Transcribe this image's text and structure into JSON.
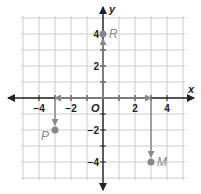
{
  "axes": {
    "x_label": "x",
    "y_label": "y",
    "origin_label": "O"
  },
  "x_ticks": [
    {
      "v": -4,
      "label": "−4"
    },
    {
      "v": -2,
      "label": "−2"
    },
    {
      "v": 2,
      "label": "2"
    },
    {
      "v": 4,
      "label": "4"
    }
  ],
  "y_ticks": [
    {
      "v": 4,
      "label": "4"
    },
    {
      "v": 2,
      "label": "2"
    },
    {
      "v": -2,
      "label": "−2"
    },
    {
      "v": -4,
      "label": "−4"
    }
  ],
  "points": [
    {
      "name": "R",
      "x": 0,
      "y": 4
    },
    {
      "name": "P",
      "x": -3,
      "y": -2
    },
    {
      "name": "M",
      "x": 3,
      "y": -4
    }
  ],
  "colors": {
    "grid": "#cccccc",
    "axis": "#222222",
    "path": "#888888",
    "point": "#888888"
  },
  "grid": {
    "min": -5,
    "max": 5
  }
}
